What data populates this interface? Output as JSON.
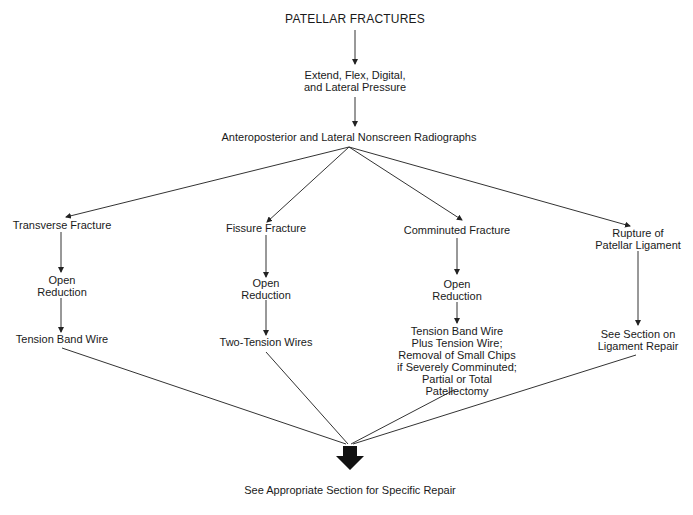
{
  "diagram": {
    "title": "PATELLAR FRACTURES",
    "step1": {
      "line1": "Extend, Flex, Digital,",
      "line2": "and Lateral Pressure"
    },
    "step2": "Anteroposterior and Lateral Nonscreen Radiographs",
    "branches": [
      {
        "type": "Transverse Fracture",
        "procedure": {
          "line1": "Open",
          "line2": "Reduction"
        },
        "treatment": [
          "Tension Band Wire"
        ]
      },
      {
        "type": "Fissure Fracture",
        "procedure": {
          "line1": "Open",
          "line2": "Reduction"
        },
        "treatment": [
          "Two-Tension Wires"
        ]
      },
      {
        "type": "Comminuted Fracture",
        "procedure": {
          "line1": "Open",
          "line2": "Reduction"
        },
        "treatment": [
          "Tension Band Wire",
          "Plus Tension Wire;",
          "Removal of Small Chips",
          "if Severely Comminuted;",
          "Partial or Total",
          "Patellectomy"
        ]
      },
      {
        "type_lines": [
          "Rupture of",
          "Patellar Ligament"
        ],
        "treatment": [
          "See Section on",
          "Ligament Repair"
        ]
      }
    ],
    "conclusion": "See Appropriate Section for Specific Repair"
  },
  "colors": {
    "line": "#333333",
    "text": "#1a1a1a",
    "background": "#ffffff"
  }
}
